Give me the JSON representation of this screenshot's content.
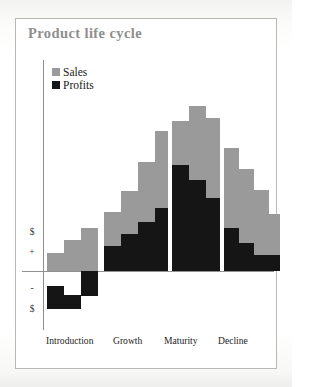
{
  "page": {
    "title": "Product life cycle",
    "title_color": "#8e8e8e",
    "frame_border_color": "#b9b9b4",
    "background": "#ffffff"
  },
  "legend": {
    "position": "top-left-inside",
    "items": [
      {
        "label": "Sales",
        "color": "#9a9a9a",
        "swatch": "sales-swatch"
      },
      {
        "label": "Profits",
        "color": "#151515",
        "swatch": "profits-swatch"
      }
    ]
  },
  "axes": {
    "y_ticks": [
      {
        "label": "$",
        "pos_px": 232
      },
      {
        "label": "+",
        "pos_px": 252
      },
      {
        "label": "-",
        "pos_px": 288
      },
      {
        "label": "$",
        "pos_px": 309
      }
    ],
    "x_ticks": [
      {
        "label": "Introduction",
        "left_px": 46
      },
      {
        "label": "Growth",
        "left_px": 113
      },
      {
        "label": "Maturity",
        "left_px": 164
      },
      {
        "label": "Decline",
        "left_px": 218
      }
    ],
    "zero_line_y_px": 271,
    "grid": false
  },
  "chart_data": {
    "type": "bar",
    "title": "Product life cycle",
    "xlabel": "",
    "ylabel": "$",
    "grid": false,
    "legend_position": "top-left",
    "zero_baseline": true,
    "categories": [
      "Introduction",
      "Introduction",
      "Introduction",
      "Growth",
      "Growth",
      "Growth",
      "Growth",
      "Maturity",
      "Maturity",
      "Maturity",
      "Decline",
      "Decline",
      "Decline",
      "Decline"
    ],
    "series": [
      {
        "name": "Sales",
        "color": "#9a9a9a",
        "values": [
          1,
          2,
          3,
          5,
          6,
          8,
          10,
          12,
          13,
          11,
          9,
          8,
          6,
          5
        ]
      },
      {
        "name": "Profits",
        "color": "#151515",
        "values": [
          -3,
          -2,
          -1,
          2,
          3,
          4,
          5,
          7,
          6,
          5,
          4,
          3,
          2,
          2
        ]
      }
    ],
    "ylim": [
      -4,
      14
    ]
  },
  "bars": {
    "geometry_note": "pixel rects in plot coordinates",
    "sales": [
      {
        "x": 47,
        "top": 253,
        "w": 17,
        "h": 18
      },
      {
        "x": 64,
        "top": 240,
        "w": 17,
        "h": 31
      },
      {
        "x": 81,
        "top": 228,
        "w": 17,
        "h": 43
      },
      {
        "x": 104,
        "top": 212,
        "w": 17,
        "h": 59
      },
      {
        "x": 121,
        "top": 191,
        "w": 17,
        "h": 80
      },
      {
        "x": 138,
        "top": 162,
        "w": 17,
        "h": 109
      },
      {
        "x": 155,
        "top": 131,
        "w": 13,
        "h": 140
      },
      {
        "x": 172,
        "top": 121,
        "w": 17,
        "h": 150
      },
      {
        "x": 189,
        "top": 106,
        "w": 17,
        "h": 165
      },
      {
        "x": 206,
        "top": 118,
        "w": 14,
        "h": 153
      },
      {
        "x": 224,
        "top": 148,
        "w": 15,
        "h": 123
      },
      {
        "x": 239,
        "top": 169,
        "w": 15,
        "h": 102
      },
      {
        "x": 254,
        "top": 190,
        "w": 15,
        "h": 81
      },
      {
        "x": 269,
        "top": 214,
        "w": 11,
        "h": 57
      }
    ],
    "profits": [
      {
        "x": 47,
        "top": 286,
        "w": 17,
        "h": 23
      },
      {
        "x": 64,
        "top": 295,
        "w": 17,
        "h": 14
      },
      {
        "x": 81,
        "top": 271,
        "w": 17,
        "h": 25
      },
      {
        "x": 104,
        "top": 246,
        "w": 17,
        "h": 25
      },
      {
        "x": 121,
        "top": 234,
        "w": 17,
        "h": 37
      },
      {
        "x": 138,
        "top": 222,
        "w": 17,
        "h": 49
      },
      {
        "x": 155,
        "top": 208,
        "w": 13,
        "h": 63
      },
      {
        "x": 172,
        "top": 165,
        "w": 17,
        "h": 106
      },
      {
        "x": 189,
        "top": 180,
        "w": 17,
        "h": 91
      },
      {
        "x": 206,
        "top": 198,
        "w": 14,
        "h": 73
      },
      {
        "x": 224,
        "top": 228,
        "w": 15,
        "h": 43
      },
      {
        "x": 239,
        "top": 243,
        "w": 15,
        "h": 28
      },
      {
        "x": 254,
        "top": 255,
        "w": 15,
        "h": 16
      },
      {
        "x": 269,
        "top": 255,
        "w": 11,
        "h": 16
      }
    ]
  }
}
